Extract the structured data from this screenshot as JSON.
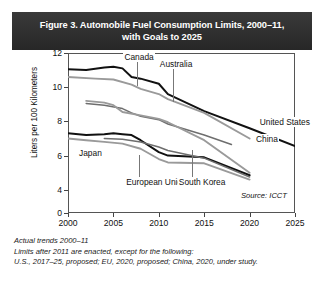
{
  "figure": {
    "title": "Figure 3. Automobile Fuel Consumption Limits, 2000–11, with Goals to 2025",
    "title_line1": "Figure 3. Automobile Fuel Consumption Limits, 2000–11,",
    "title_line2": "with Goals to 2025",
    "source_note": "Source: ICCT",
    "footnotes": [
      "Actual trends 2000–11",
      "Limits after 2011 are enacted, except for the following:",
      "U.S., 2017–25, proposed; EU, 2020, proposed; China, 2020, under study."
    ]
  },
  "colors": {
    "header_background": "#2e2e2e",
    "header_text": "#ffffff",
    "plot_background": "#ffffff",
    "axis": "#555555",
    "dark_series": "#111111",
    "gray_series": "#9a9a9a",
    "mid_series": "#6e6e6e",
    "leader_line": "#777777"
  },
  "chart_data": {
    "type": "line",
    "title": "Figure 3. Automobile Fuel Consumption Limits, 2000–11, with Goals to 2025",
    "xlabel": "",
    "ylabel": "Liters per 100 Kilometers",
    "xlim": [
      2000,
      2025
    ],
    "ylim": [
      0,
      12
    ],
    "grid": false,
    "legend": "inline-labels",
    "broken_y_axis": true,
    "y_ticks": [
      0,
      4,
      6,
      8,
      10,
      12
    ],
    "y_tick_labels": [
      "0",
      "4",
      "6",
      "8",
      "10",
      "12"
    ],
    "x_ticks": [
      2000,
      2005,
      2010,
      2015,
      2020,
      2025
    ],
    "x_tick_labels": [
      "2000",
      "2005",
      "2010",
      "2015",
      "2020",
      "2025"
    ],
    "annotations": [
      "Source: ICCT"
    ],
    "series": [
      {
        "name": "United States",
        "style": "dark",
        "label_x": 2021.0,
        "label_y": 7.95,
        "leader": false,
        "x": [
          2000,
          2002,
          2004,
          2005,
          2006,
          2007,
          2008,
          2010,
          2011,
          2015,
          2020,
          2025
        ],
        "values": [
          11.05,
          11.0,
          11.15,
          11.2,
          11.1,
          10.6,
          10.5,
          10.2,
          9.6,
          8.6,
          7.6,
          6.55
        ]
      },
      {
        "name": "Canada",
        "style": "gray",
        "label_x": 2006.1,
        "label_y": 11.75,
        "leader": true,
        "leader_to_y": 10.05,
        "x": [
          2000,
          2003,
          2005,
          2007,
          2008,
          2010,
          2011,
          2015,
          2020
        ],
        "values": [
          10.6,
          10.5,
          10.45,
          10.15,
          9.9,
          9.6,
          9.3,
          8.5,
          7.0
        ]
      },
      {
        "name": "Australia",
        "style": "mid",
        "label_x": 2010.0,
        "label_y": 11.35,
        "leader": true,
        "leader_to_y": 9.15,
        "x": [
          2002,
          2004,
          2006,
          2007,
          2008,
          2010,
          2011,
          2015,
          2018
        ],
        "values": [
          9.05,
          8.95,
          8.75,
          8.5,
          8.3,
          8.1,
          7.85,
          7.2,
          6.65
        ]
      },
      {
        "name": "China",
        "style": "gray",
        "label_x": 2020.6,
        "label_y": 6.95,
        "leader": false,
        "x": [
          2002,
          2004,
          2005,
          2006,
          2008,
          2010,
          2011,
          2015,
          2020
        ],
        "values": [
          9.2,
          9.1,
          8.95,
          8.55,
          8.35,
          8.15,
          7.95,
          6.9,
          5.0
        ]
      },
      {
        "name": "Japan",
        "style": "dark",
        "label_x": 2001.1,
        "label_y": 6.15,
        "leader": false,
        "x": [
          2000,
          2002,
          2004,
          2005,
          2006,
          2007,
          2008,
          2010,
          2011,
          2015,
          2020
        ],
        "values": [
          7.3,
          7.2,
          7.25,
          7.3,
          7.25,
          7.2,
          6.9,
          6.2,
          6.0,
          5.9,
          4.85
        ]
      },
      {
        "name": "European Union",
        "style": "gray",
        "label_x": 2006.3,
        "label_y": 4.45,
        "leader": true,
        "leader_to_y": 6.05,
        "x": [
          2000,
          2002,
          2004,
          2006,
          2008,
          2010,
          2011,
          2015,
          2020
        ],
        "values": [
          7.0,
          6.9,
          6.8,
          6.7,
          6.4,
          5.8,
          5.6,
          5.55,
          4.6
        ]
      },
      {
        "name": "South Korea",
        "style": "mid",
        "label_x": 2012.1,
        "label_y": 4.45,
        "leader": true,
        "leader_to_y": 6.35,
        "x": [
          2004,
          2006,
          2008,
          2010,
          2011,
          2015,
          2020
        ],
        "values": [
          7.0,
          6.95,
          6.8,
          6.5,
          6.3,
          5.85,
          4.75
        ]
      }
    ]
  }
}
